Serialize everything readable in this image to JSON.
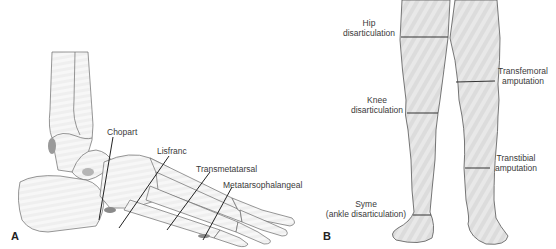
{
  "figure": {
    "panels": [
      {
        "id": "A",
        "label": "A",
        "subject": "lateral view of foot and ankle bones",
        "levels": [
          {
            "name": "Chopart"
          },
          {
            "name": "Lisfranc"
          },
          {
            "name": "Transmetatarsal"
          },
          {
            "name": "Metatarsophalangeal"
          }
        ]
      },
      {
        "id": "B",
        "label": "B",
        "subject": "anterior view of lower limbs",
        "levels": [
          {
            "line1": "Hip",
            "line2": "disarticulation"
          },
          {
            "line1": "Transfemoral",
            "line2": "amputation"
          },
          {
            "line1": "Knee",
            "line2": "disarticulation"
          },
          {
            "line1": "Transtibial",
            "line2": "amputation"
          },
          {
            "line1": "Syme",
            "line2": "(ankle disarticulation)"
          }
        ]
      }
    ],
    "colors": {
      "line": "#333333",
      "bone_outline": "#555555",
      "leg_fill": "#e6e6e6",
      "leg_stripe": "#d4d4d4",
      "text": "#3a3a3a"
    }
  }
}
